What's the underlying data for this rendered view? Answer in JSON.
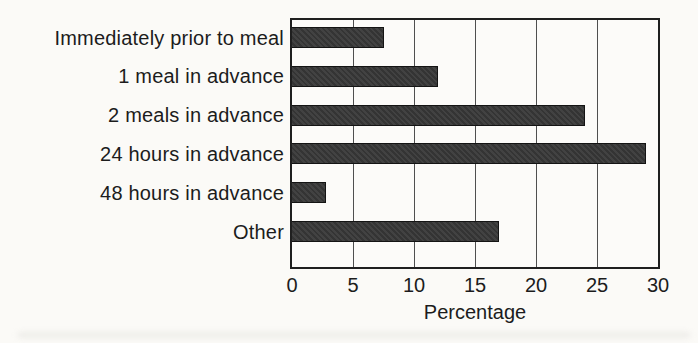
{
  "figure": {
    "background_color": "#fbfaf7",
    "bar_color": "#383838",
    "bar_border_color": "#141414",
    "axis_border_color": "#1f1f1f",
    "gridline_color": "#4f4f4f",
    "text_color": "#1c1c1c"
  },
  "chart_data": {
    "type": "bar",
    "orientation": "horizontal",
    "title": "",
    "categories": [
      "Immediately prior to meal",
      "1 meal in advance",
      "2 meals in advance",
      "24 hours in advance",
      "48 hours in advance",
      "Other"
    ],
    "values": [
      7.5,
      12,
      24,
      29,
      2.8,
      17
    ],
    "xlabel": "Percentage",
    "ylabel": "",
    "xlim": [
      0,
      30
    ],
    "xticks": [
      0,
      5,
      10,
      15,
      20,
      25,
      30
    ],
    "grid": "vertical gridlines at every x tick, drawn behind bars",
    "legend": "none"
  }
}
